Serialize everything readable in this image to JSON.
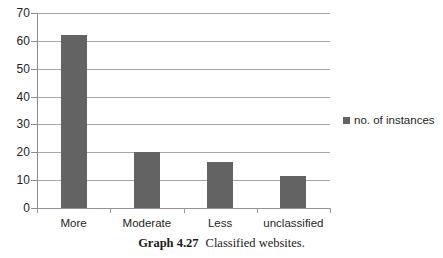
{
  "chart_data": {
    "type": "bar",
    "title": "",
    "subtitle": "",
    "xlabel": "",
    "ylabel": "",
    "categories": [
      "More",
      "Moderate",
      "Less",
      "unclassified"
    ],
    "series": [
      {
        "name": "no. of instances",
        "values": [
          62,
          20,
          16.5,
          11.5
        ],
        "color": "#636363"
      }
    ],
    "ylim": [
      0,
      70
    ],
    "yticks": [
      0,
      10,
      20,
      30,
      40,
      50,
      60,
      70
    ],
    "ytick_labels": [
      "0",
      "10",
      "20",
      "30",
      "40",
      "50",
      "60",
      "70"
    ],
    "grid": true,
    "grid_axis": "y",
    "legend_position": "right"
  },
  "legend": {
    "entries": [
      {
        "label": "no. of instances",
        "color": "#636363",
        "marker": "square-swatch"
      }
    ]
  },
  "caption": {
    "number": "Graph 4.27",
    "text": "Classified websites."
  },
  "colors": {
    "bar": "#636363",
    "gridline": "#a6a6a6",
    "axis": "#8d8d8d",
    "text": "#231f20",
    "background": "#ffffff"
  }
}
